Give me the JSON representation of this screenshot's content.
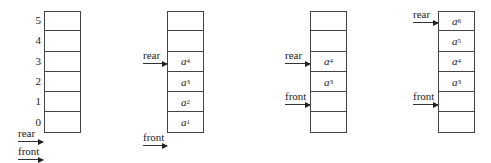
{
  "diagram": {
    "index_labels": [
      "5",
      "4",
      "3",
      "2",
      "1",
      "0"
    ],
    "pointer_labels": {
      "rear": "rear",
      "front": "front"
    },
    "queues": [
      {
        "name": "empty-queue",
        "cells": [
          {
            "base": "",
            "sub": ""
          },
          {
            "base": "",
            "sub": ""
          },
          {
            "base": "",
            "sub": ""
          },
          {
            "base": "",
            "sub": ""
          },
          {
            "base": "",
            "sub": ""
          },
          {
            "base": "",
            "sub": ""
          }
        ],
        "rear_at": "below-0",
        "front_at": "below-0"
      },
      {
        "name": "queue-after-enqueue",
        "cells": [
          {
            "base": "",
            "sub": ""
          },
          {
            "base": "",
            "sub": ""
          },
          {
            "base": "a",
            "sub": "4"
          },
          {
            "base": "a",
            "sub": "3"
          },
          {
            "base": "a",
            "sub": "2"
          },
          {
            "base": "a",
            "sub": "1"
          }
        ],
        "rear_at": "3",
        "front_at": "below-0"
      },
      {
        "name": "queue-after-dequeue",
        "cells": [
          {
            "base": "",
            "sub": ""
          },
          {
            "base": "",
            "sub": ""
          },
          {
            "base": "a",
            "sub": "4"
          },
          {
            "base": "a",
            "sub": "3"
          },
          {
            "base": "",
            "sub": ""
          },
          {
            "base": "",
            "sub": ""
          }
        ],
        "rear_at": "3",
        "front_at": "1"
      },
      {
        "name": "queue-full-overflow",
        "cells": [
          {
            "base": "a",
            "sub": "6"
          },
          {
            "base": "a",
            "sub": "5"
          },
          {
            "base": "a",
            "sub": "4"
          },
          {
            "base": "a",
            "sub": "3"
          },
          {
            "base": "",
            "sub": ""
          },
          {
            "base": "",
            "sub": ""
          }
        ],
        "rear_at": "5",
        "front_at": "1"
      }
    ]
  }
}
